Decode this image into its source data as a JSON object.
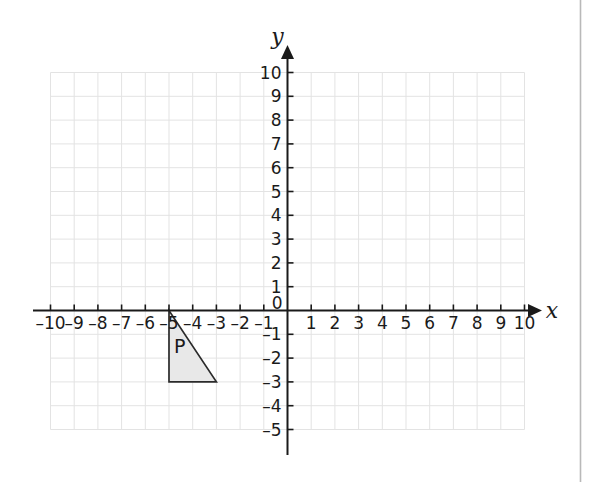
{
  "figure": {
    "title": "",
    "background_color": "#ffffff",
    "right_border_color": "#b9b9b9"
  },
  "axis_labels": {
    "x_axis_name": "x",
    "y_axis_name": "y",
    "origin_label": "0"
  },
  "chart_data": {
    "type": "scatter",
    "title": "",
    "xlabel": "x",
    "ylabel": "y",
    "xlim": [
      -10,
      10
    ],
    "ylim": [
      -5,
      10
    ],
    "grid": true,
    "grid_color": "#e3e3e3",
    "grid_spacing": 1,
    "axis_color": "#1a1a1a",
    "legend": "none",
    "x_ticks": [
      -10,
      -9,
      -8,
      -7,
      -6,
      -5,
      -4,
      -3,
      -2,
      -1,
      1,
      2,
      3,
      4,
      5,
      6,
      7,
      8,
      9,
      10
    ],
    "x_tick_labels": [
      "–10",
      "–9",
      "–8",
      "–7",
      "–6",
      "–5",
      "–4",
      "–3",
      "–2",
      "–1",
      "1",
      "2",
      "3",
      "4",
      "5",
      "6",
      "7",
      "8",
      "9",
      "10"
    ],
    "y_ticks": [
      10,
      9,
      8,
      7,
      6,
      5,
      4,
      3,
      2,
      1,
      -1,
      -2,
      -3,
      -4,
      -5
    ],
    "y_tick_labels": [
      "10",
      "9",
      "8",
      "7",
      "6",
      "5",
      "4",
      "3",
      "2",
      "1",
      "–1",
      "–2",
      "–3",
      "–4",
      "–5"
    ],
    "shapes": [
      {
        "name": "P",
        "label": "P",
        "kind": "triangle",
        "vertices": [
          [
            -5,
            0
          ],
          [
            -5,
            -3
          ],
          [
            -3,
            -3
          ]
        ],
        "fill_color": "#e8e8e8",
        "stroke_color": "#2b2b2b",
        "label_position": [
          -4.55,
          -1.55
        ]
      }
    ]
  }
}
